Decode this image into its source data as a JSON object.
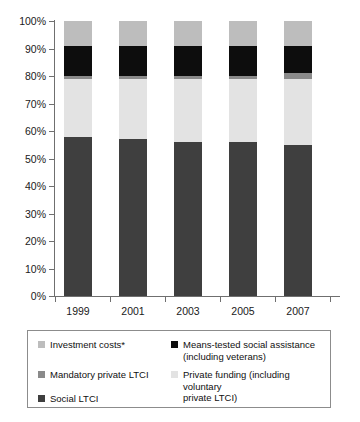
{
  "chart_data": {
    "type": "bar",
    "subtype": "stacked-100-percent",
    "title": "",
    "xlabel": "",
    "ylabel": "",
    "categories": [
      "1999",
      "2001",
      "2003",
      "2005",
      "2007"
    ],
    "ylim": [
      0,
      100
    ],
    "y_tick_labels": [
      "0%",
      "10%",
      "20%",
      "30%",
      "40%",
      "50%",
      "60%",
      "70%",
      "80%",
      "90%",
      "100%"
    ],
    "y_ticks": [
      0,
      10,
      20,
      30,
      40,
      50,
      60,
      70,
      80,
      90,
      100
    ],
    "grid": false,
    "legend_position": "bottom",
    "series": [
      {
        "name": "Social LTCI",
        "color": "#3f3f3f",
        "values": [
          58,
          57,
          56,
          56,
          55
        ]
      },
      {
        "name": "Private funding (including voluntary private LTCI)",
        "color": "#e3e3e3",
        "values": [
          21,
          22,
          23,
          23,
          24
        ]
      },
      {
        "name": "Mandatory private LTCI",
        "color": "#8a8a8a",
        "values": [
          1,
          1,
          1,
          1,
          2
        ]
      },
      {
        "name": "Means-tested social assistance (including veterans)",
        "color": "#0d0d0d",
        "values": [
          11,
          11,
          11,
          11,
          10
        ]
      },
      {
        "name": "Investment costs*",
        "color": "#bdbdbd",
        "values": [
          9,
          9,
          9,
          9,
          9
        ]
      }
    ]
  },
  "legend": {
    "items": [
      {
        "label": "Investment costs*",
        "color": "#bdbdbd"
      },
      {
        "label": "Means-tested social assistance\n(including veterans)",
        "color": "#0d0d0d"
      },
      {
        "label": "Mandatory private LTCI",
        "color": "#8a8a8a"
      },
      {
        "label": "Private funding (including voluntary\nprivate LTCI)",
        "color": "#e3e3e3"
      },
      {
        "label": "Social LTCI",
        "color": "#3f3f3f"
      }
    ]
  },
  "axis": {
    "y_labels": [
      "100%",
      "90%",
      "80%",
      "70%",
      "60%",
      "50%",
      "40%",
      "30%",
      "20%",
      "10%",
      "0%"
    ],
    "x_labels": [
      "1999",
      "2001",
      "2003",
      "2005",
      "2007"
    ]
  }
}
